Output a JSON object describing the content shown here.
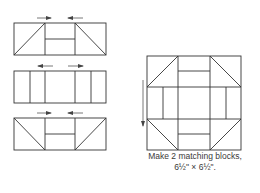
{
  "diagram": {
    "stroke_color": "#333333",
    "arrow_color": "#555555",
    "units": [
      {
        "name": "top-unit",
        "arrows": [
          {
            "direction": "right"
          },
          {
            "direction": "left"
          }
        ]
      },
      {
        "name": "middle-unit",
        "arrows": [
          {
            "direction": "left"
          },
          {
            "direction": "right"
          }
        ]
      },
      {
        "name": "bottom-unit",
        "arrows": [
          {
            "direction": "right"
          },
          {
            "direction": "left"
          }
        ]
      }
    ],
    "block": {
      "pressing_arrow": {
        "direction": "down"
      }
    },
    "caption": {
      "line1": "Make 2 matching blocks,",
      "line2": "6½\" × 6½\"."
    }
  }
}
